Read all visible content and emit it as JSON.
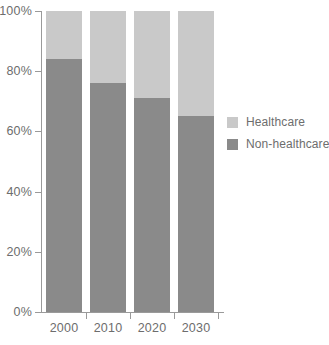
{
  "chart_data": {
    "type": "bar",
    "stacked": true,
    "title": "",
    "xlabel": "",
    "ylabel": "",
    "categories": [
      "2000",
      "2010",
      "2020",
      "2030"
    ],
    "series": [
      {
        "name": "Non-healthcare",
        "color": "#8a8a8a",
        "values": [
          84,
          76,
          71,
          65
        ]
      },
      {
        "name": "Healthcare",
        "color": "#c9c9c9",
        "values": [
          16,
          24,
          29,
          35
        ]
      }
    ],
    "ylim": [
      0,
      100
    ],
    "yticks": [
      0,
      20,
      40,
      60,
      80,
      100
    ],
    "ytick_labels": [
      "0%",
      "20%",
      "40%",
      "60%",
      "80%",
      "100%"
    ],
    "grid": false,
    "legend_position": "right",
    "legend_entries": [
      "Healthcare",
      "Non-healthcare"
    ],
    "axis_color": "#9a9a9a",
    "label_color": "#6d6d6d"
  }
}
